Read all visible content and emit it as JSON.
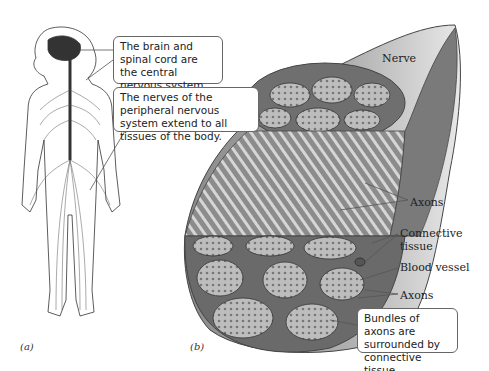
{
  "figure": {
    "panel_a": {
      "label": "(a)",
      "callouts": [
        {
          "text": "The brain and spinal cord are the central nervous system."
        },
        {
          "text": "The nerves of the peripheral nervous system extend to all tissues of the body."
        }
      ]
    },
    "panel_b": {
      "label": "(b)",
      "labels": {
        "nerve": "Nerve",
        "axons_top": "Axons",
        "connective_tissue": "Connective tissue",
        "blood_vessel": "Blood vessel",
        "axons_bottom": "Axons"
      },
      "callout": {
        "text": "Bundles of axons are surrounded by connective tissue."
      }
    }
  },
  "colors": {
    "nerve_fill": "#9a9a9a",
    "bundle_fill": "#b8b8b8",
    "outline": "#444444"
  }
}
